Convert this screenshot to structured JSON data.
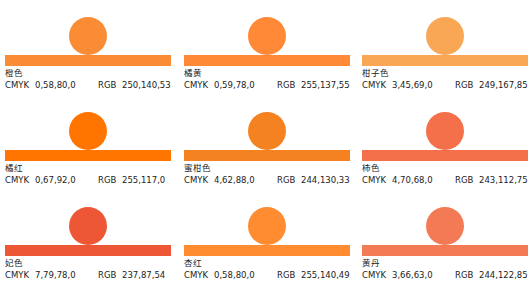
{
  "labels": {
    "cmyk": "CMYK",
    "rgb": "RGB"
  },
  "swatches": [
    {
      "name": "橙色",
      "cmyk": "0,58,80,0",
      "rgb": "250,140,53",
      "color": "#fa8c35"
    },
    {
      "name": "橘黄",
      "cmyk": "0,59,78,0",
      "rgb": "255,137,55",
      "color": "#ff8937"
    },
    {
      "name": "柑子色",
      "cmyk": "3,45,69,0",
      "rgb": "249,167,85",
      "color": "#f9a755"
    },
    {
      "name": "橘红",
      "cmyk": "0,67,92,0",
      "rgb": "255,117,0",
      "color": "#ff7500"
    },
    {
      "name": "蜜柑色",
      "cmyk": "4,62,88,0",
      "rgb": "244,130,33",
      "color": "#f48221"
    },
    {
      "name": "柿色",
      "cmyk": "4,70,68,0",
      "rgb": "243,112,75",
      "color": "#f3704b"
    },
    {
      "name": "妃色",
      "cmyk": "7,79,78,0",
      "rgb": "237,87,54",
      "color": "#ed5736"
    },
    {
      "name": "杏红",
      "cmyk": "0,58,80,0",
      "rgb": "255,140,49",
      "color": "#ff8c31"
    },
    {
      "name": "黄丹",
      "cmyk": "3,66,63,0",
      "rgb": "244,122,85",
      "color": "#f47a55"
    }
  ]
}
